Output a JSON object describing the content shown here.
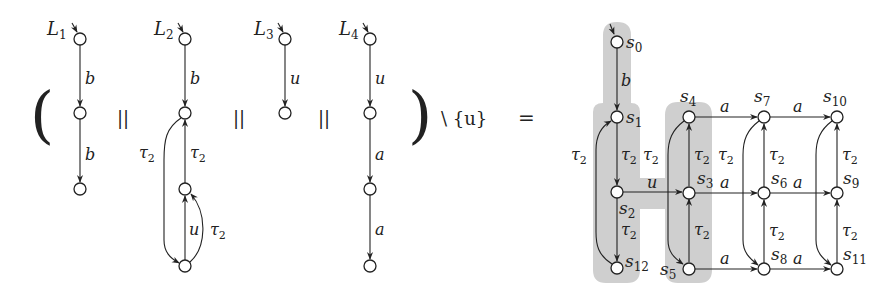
{
  "equation": {
    "left_paren": "(",
    "right_paren": ")",
    "parallel": "||",
    "hiding": "\\ {u}",
    "equals": "="
  },
  "lts_components": [
    {
      "name": "L",
      "index": "1",
      "states": 3,
      "transitions": [
        {
          "from": 0,
          "to": 1,
          "label": "b"
        },
        {
          "from": 1,
          "to": 2,
          "label": "b"
        }
      ]
    },
    {
      "name": "L",
      "index": "2",
      "states": 4,
      "transitions": [
        {
          "from": 0,
          "to": 1,
          "label": "b"
        },
        {
          "from": 2,
          "to": 1,
          "label": "τ",
          "sub": "2"
        },
        {
          "from": 1,
          "to": 3,
          "label": "τ",
          "sub": "2"
        },
        {
          "from": 3,
          "to": 2,
          "label": "u"
        },
        {
          "from": 3,
          "to": 2,
          "label": "τ",
          "sub": "2"
        }
      ]
    },
    {
      "name": "L",
      "index": "3",
      "states": 2,
      "transitions": [
        {
          "from": 0,
          "to": 1,
          "label": "u"
        }
      ]
    },
    {
      "name": "L",
      "index": "4",
      "states": 4,
      "transitions": [
        {
          "from": 0,
          "to": 1,
          "label": "u"
        },
        {
          "from": 1,
          "to": 2,
          "label": "a"
        },
        {
          "from": 2,
          "to": 3,
          "label": "a"
        }
      ]
    }
  ],
  "result": {
    "states": [
      "s0",
      "s1",
      "s2",
      "s3",
      "s4",
      "s5",
      "s6",
      "s7",
      "s8",
      "s9",
      "s10",
      "s11",
      "s12"
    ],
    "initial": "s0",
    "highlight_color": "#cfcfcf",
    "transitions": [
      {
        "from": "s0",
        "to": "s1",
        "label": "b"
      },
      {
        "from": "s1",
        "to": "s2",
        "label": "τ2"
      },
      {
        "from": "s2",
        "to": "s12",
        "label": "τ2"
      },
      {
        "from": "s12",
        "to": "s1",
        "label": "τ2"
      },
      {
        "from": "s2",
        "to": "s3",
        "label": "u"
      },
      {
        "from": "s3",
        "to": "s4",
        "label": "τ2"
      },
      {
        "from": "s5",
        "to": "s3",
        "label": "τ2"
      },
      {
        "from": "s4",
        "to": "s5",
        "label": "τ2"
      },
      {
        "from": "s4",
        "to": "s7",
        "label": "a"
      },
      {
        "from": "s7",
        "to": "s10",
        "label": "a"
      },
      {
        "from": "s3",
        "to": "s6",
        "label": "a"
      },
      {
        "from": "s6",
        "to": "s9",
        "label": "a"
      },
      {
        "from": "s5",
        "to": "s8",
        "label": "a"
      },
      {
        "from": "s8",
        "to": "s11",
        "label": "a"
      },
      {
        "from": "s6",
        "to": "s7",
        "label": "τ2"
      },
      {
        "from": "s8",
        "to": "s6",
        "label": "τ2"
      },
      {
        "from": "s7",
        "to": "s8",
        "label": "τ2"
      },
      {
        "from": "s9",
        "to": "s10",
        "label": "τ2"
      },
      {
        "from": "s11",
        "to": "s9",
        "label": "τ2"
      },
      {
        "from": "s10",
        "to": "s11",
        "label": "τ2"
      }
    ]
  },
  "labels": {
    "b": "b",
    "u": "u",
    "a": "a",
    "tau": "τ",
    "tau_sub": "2",
    "s": "s"
  }
}
